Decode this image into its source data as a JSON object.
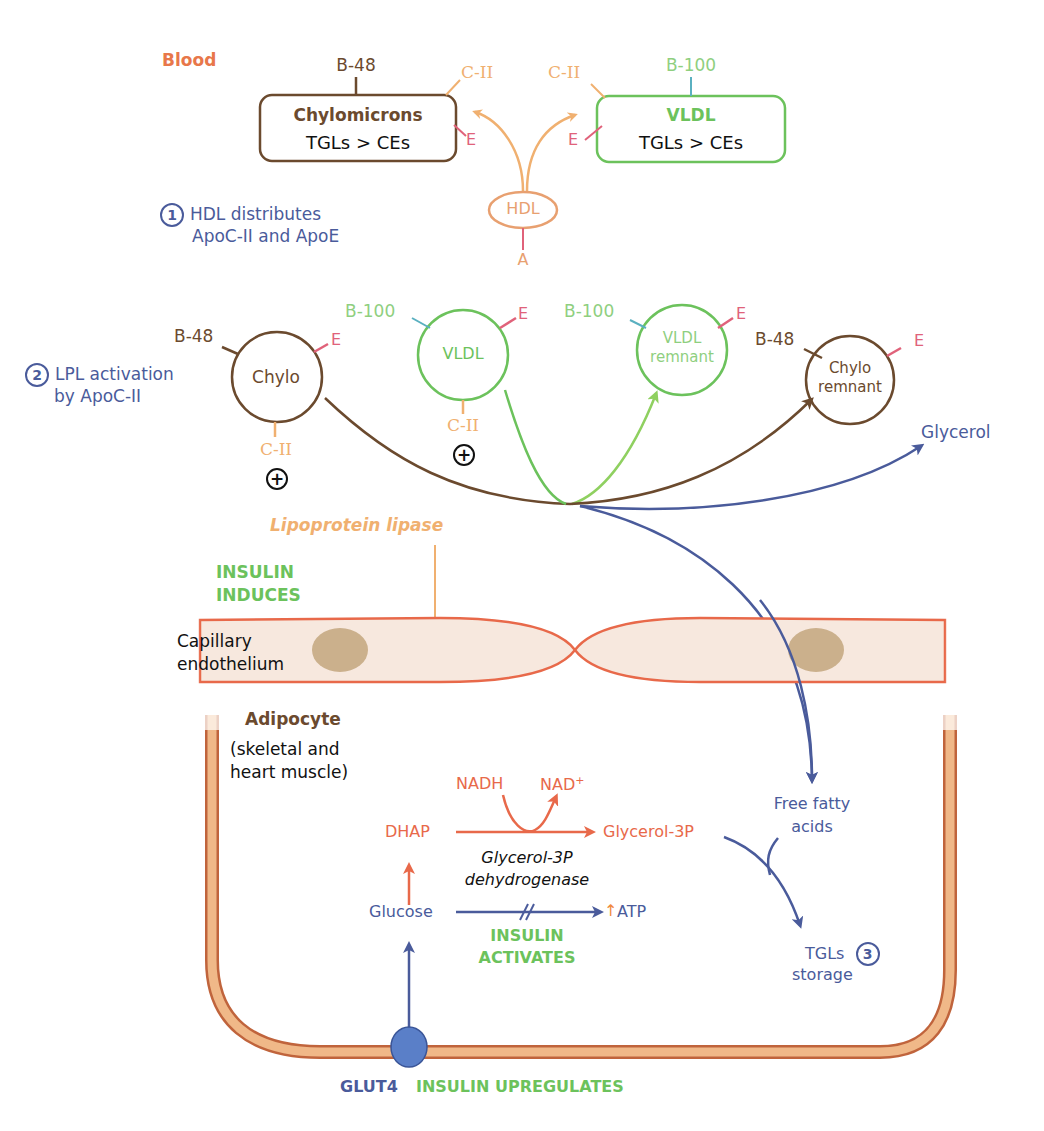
{
  "colors": {
    "blood_label": "#e8774a",
    "chylo_brown": "#6b4a2e",
    "vldl_green": "#6cc25c",
    "apo_c2_orange": "#f0b070",
    "apo_e_pink": "#e0627a",
    "b100_green": "#8fcf7f",
    "hdl_orange": "#e8a070",
    "step_blue": "#4a5b9b",
    "insulin_green": "#6cc25c",
    "pathway_red": "#e8694a",
    "membrane": "#e8694a",
    "membrane_fill": "#f7e8de",
    "nucleus": "#cbb08c",
    "adipocyte_membrane": "#f0b888",
    "adipocyte_outline": "#c0643c",
    "glut4_blue": "#5a7fc8"
  },
  "blood": {
    "label": "Blood",
    "chylomicrons": {
      "title": "Chylomicrons",
      "subtitle": "TGLs > CEs",
      "apo_b": "B-48",
      "apo_c": "C-II",
      "apo_e": "E"
    },
    "vldl": {
      "title": "VLDL",
      "subtitle": "TGLs > CEs",
      "apo_b": "B-100",
      "apo_c": "C-II",
      "apo_e": "E"
    },
    "hdl": {
      "label": "HDL",
      "apo_a": "A"
    },
    "step1": {
      "number": "1",
      "line1": "HDL distributes",
      "line2": "ApoC-II and ApoE"
    }
  },
  "lpl": {
    "step2": {
      "number": "2",
      "line1": "LPL activation",
      "line2": "by ApoC-II"
    },
    "chylo": {
      "label": "Chylo",
      "apo_b": "B-48",
      "apo_e": "E",
      "apo_c": "C-II"
    },
    "vldl": {
      "label": "VLDL",
      "apo_b": "B-100",
      "apo_e": "E",
      "apo_c": "C-II"
    },
    "vldl_remnant": {
      "line1": "VLDL",
      "line2": "remnant",
      "apo_b": "B-100",
      "apo_e": "E"
    },
    "chylo_remnant": {
      "line1": "Chylo",
      "line2": "remnant",
      "apo_b": "B-48",
      "apo_e": "E"
    },
    "plus_symbol": "+",
    "glycerol": "Glycerol",
    "enzyme": "Lipoprotein lipase",
    "insulin_induces_1": "INSULIN",
    "insulin_induces_2": "INDUCES"
  },
  "capillary": {
    "line1": "Capillary",
    "line2": "endothelium"
  },
  "adipocyte": {
    "title": "Adipocyte",
    "sub1": "(skeletal and",
    "sub2": "heart muscle)",
    "nadh": "NADH",
    "nad": "NAD",
    "nad_sup": "+",
    "dhap": "DHAP",
    "glycerol_3p": "Glycerol-3P",
    "enzyme1": "Glycerol-3P",
    "enzyme2": "dehydrogenase",
    "glucose": "Glucose",
    "atp_arrow": "↑",
    "atp": "ATP",
    "insulin_activates_1": "INSULIN",
    "insulin_activates_2": "ACTIVATES",
    "ffa1": "Free fatty",
    "ffa2": "acids",
    "tgl1": "TGLs",
    "tgl2": "storage",
    "step3": "3"
  },
  "glut4": {
    "label": "GLUT4",
    "insulin_upregulates": "INSULIN UPREGULATES"
  }
}
